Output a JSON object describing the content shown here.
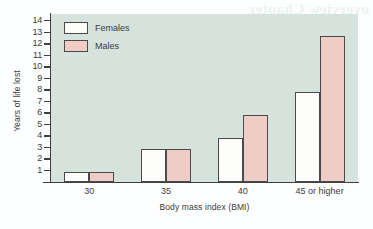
{
  "bleed_text": "overview Chapter",
  "chart_data": {
    "type": "bar",
    "title": "",
    "xlabel": "Body mass index (BMI)",
    "ylabel": "Years of life lost",
    "categories": [
      "30",
      "35",
      "40",
      "45 or higher"
    ],
    "series": [
      {
        "name": "Females",
        "color": "#fdfdfb",
        "values": [
          0.9,
          2.85,
          3.85,
          7.8
        ]
      },
      {
        "name": "Males",
        "color": "#efcdc6",
        "values": [
          0.9,
          2.85,
          5.8,
          12.7
        ]
      }
    ],
    "ylim": [
      0,
      14.6
    ],
    "yticks": [
      14,
      13,
      12,
      11,
      10,
      9,
      8,
      7,
      6,
      5,
      4,
      3,
      2,
      1
    ],
    "grid": false,
    "legend_position": "top-left",
    "plot_background": "#d6e3dc",
    "axis_color": "#3f3f3f"
  }
}
